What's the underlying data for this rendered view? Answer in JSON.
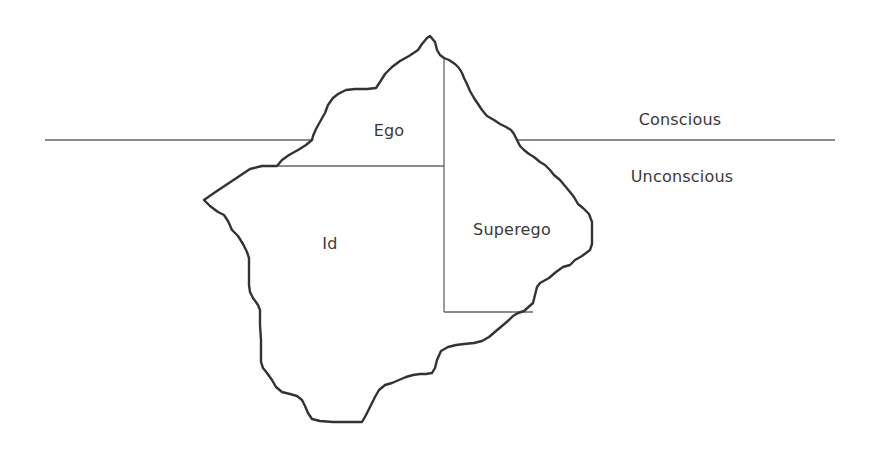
{
  "diagram": {
    "type": "iceberg-model",
    "labels": {
      "conscious": "Conscious",
      "unconscious": "Unconscious",
      "ego": "Ego",
      "id": "Id",
      "superego": "Superego"
    },
    "colors": {
      "outline": "#333333",
      "divider": "#555555",
      "waterline": "#555555",
      "text": "#3a3a3a",
      "background": "#ffffff"
    }
  }
}
